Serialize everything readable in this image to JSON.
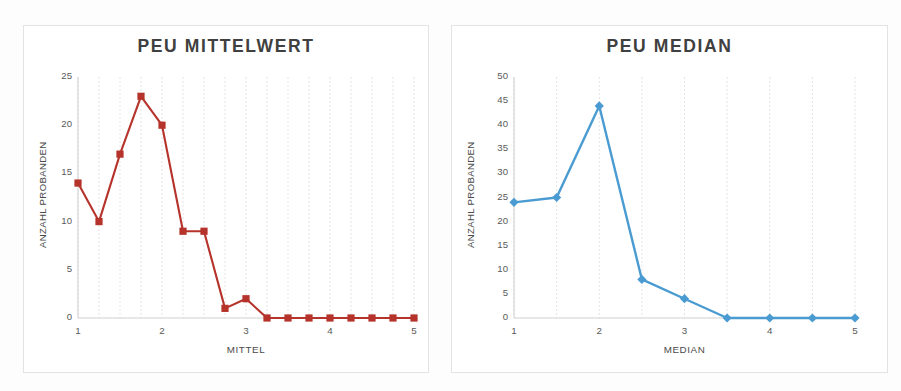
{
  "figure": {
    "background_color": "#fdfdfd",
    "panel_border_color": "#e3e3e3"
  },
  "panels": [
    {
      "id": "peu-mittelwert",
      "title": "PEU MITTELWERT",
      "xlabel": "MITTEL",
      "ylabel": "ANZAHL PROBANDEN",
      "series_color": "#b5332a",
      "marker": "square",
      "xticks": [
        "1",
        "2",
        "3",
        "4",
        "5"
      ],
      "yticks": [
        "0",
        "5",
        "10",
        "15",
        "20",
        "25"
      ]
    },
    {
      "id": "peu-median",
      "title": "PEU MEDIAN",
      "xlabel": "MEDIAN",
      "ylabel": "ANZAHL PROBANDEN",
      "series_color": "#4a9bd1",
      "marker": "diamond",
      "xticks": [
        "1",
        "2",
        "3",
        "4",
        "5"
      ],
      "yticks": [
        "0",
        "5",
        "10",
        "15",
        "20",
        "25",
        "30",
        "35",
        "40",
        "45",
        "50"
      ]
    }
  ],
  "chart_data": [
    {
      "type": "line",
      "title": "PEU MITTELWERT",
      "xlabel": "MITTEL",
      "ylabel": "ANZAHL PROBANDEN",
      "x": [
        1,
        1.25,
        1.5,
        1.75,
        2,
        2.25,
        2.5,
        2.75,
        3,
        3.25,
        3.5,
        3.75,
        4,
        4.25,
        4.5,
        4.75,
        5
      ],
      "values": [
        14,
        10,
        17,
        23,
        20,
        9,
        9,
        1,
        2,
        0,
        0,
        0,
        0,
        0,
        0,
        0,
        0
      ],
      "xlim": [
        1,
        5
      ],
      "ylim": [
        0,
        25
      ],
      "xtick_values": [
        1,
        2,
        3,
        4,
        5
      ],
      "ytick_values": [
        0,
        5,
        10,
        15,
        20,
        25
      ],
      "color": "#b5332a",
      "marker": "square",
      "grid": "vertical-dashed",
      "legend": "none"
    },
    {
      "type": "line",
      "title": "PEU MEDIAN",
      "xlabel": "MEDIAN",
      "ylabel": "ANZAHL PROBANDEN",
      "x": [
        1,
        1.5,
        2,
        2.5,
        3,
        3.5,
        4,
        4.5,
        5
      ],
      "values": [
        24,
        25,
        44,
        8,
        4,
        0,
        0,
        0,
        0
      ],
      "xlim": [
        1,
        5
      ],
      "ylim": [
        0,
        50
      ],
      "xtick_values": [
        1,
        2,
        3,
        4,
        5
      ],
      "ytick_values": [
        0,
        5,
        10,
        15,
        20,
        25,
        30,
        35,
        40,
        45,
        50
      ],
      "color": "#4a9bd1",
      "marker": "diamond",
      "grid": "vertical-dashed",
      "legend": "none"
    }
  ]
}
